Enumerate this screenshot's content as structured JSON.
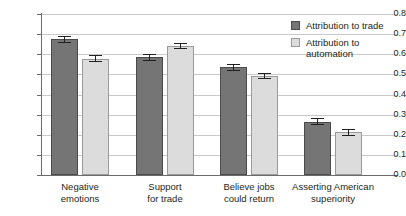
{
  "chart_data": {
    "type": "bar",
    "title": "",
    "subtitle": "",
    "xlabel": "",
    "ylabel": "",
    "ylim": [
      0.0,
      0.8
    ],
    "ytick_labels": [
      "0.8",
      "0.7",
      "0.6",
      "0.5",
      "0.4",
      "0.3",
      "0.2",
      "0.1",
      "0.0"
    ],
    "ytick_values": [
      0.8,
      0.7,
      0.6,
      0.5,
      0.4,
      0.3,
      0.2,
      0.1,
      0.0
    ],
    "grid": true,
    "legend_position": "top-right",
    "categories": [
      "Negative emotions",
      "Support for trade",
      "Believe jobs could return",
      "Asserting American superiority"
    ],
    "category_lines": [
      [
        "Negative",
        "emotions"
      ],
      [
        "Support",
        "for trade"
      ],
      [
        "Believe jobs",
        "could return"
      ],
      [
        "Asserting American",
        "superiority"
      ]
    ],
    "series": [
      {
        "name": "Attribution to trade",
        "color": "#757575",
        "border_color": "#4a4a4a",
        "values": [
          0.675,
          0.585,
          0.535,
          0.265
        ],
        "errors": [
          0.018,
          0.017,
          0.017,
          0.016
        ]
      },
      {
        "name": "Attribution to automation",
        "color": "#dcdcdc",
        "border_color": "#9a9a9a",
        "values": [
          0.578,
          0.642,
          0.492,
          0.212
        ],
        "errors": [
          0.019,
          0.016,
          0.017,
          0.016
        ]
      }
    ]
  },
  "legend": {
    "items": [
      {
        "label": "Attribution to trade",
        "swatch": "trade"
      },
      {
        "label": "Attribution to automation",
        "swatch": "automation"
      }
    ]
  },
  "colors": {
    "trade": "#757575",
    "automation": "#dcdcdc",
    "grid": "#c9c9c9",
    "axis": "#6b6b6b",
    "text": "#231f20",
    "background": "#ffffff"
  }
}
